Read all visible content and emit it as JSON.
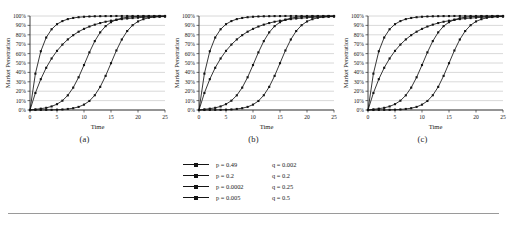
{
  "figure": {
    "panel_captions": [
      "(a)",
      "(b)",
      "(c)"
    ]
  },
  "legend": {
    "rows": [
      {
        "p_label": "p = 0.49",
        "q_label": "q = 0.002"
      },
      {
        "p_label": "p = 0.2",
        "q_label": "q = 0.2"
      },
      {
        "p_label": "p = 0.0002",
        "q_label": "q = 0.25"
      },
      {
        "p_label": "p = 0.005",
        "q_label": "q = 0.5"
      }
    ]
  },
  "chart_data": [
    {
      "type": "line",
      "title": "(a)",
      "xlabel": "Time",
      "ylabel": "Market Penetration",
      "xlim": [
        0,
        25
      ],
      "ylim": [
        0,
        1
      ],
      "grid": true,
      "legend_position": "below-figure",
      "xticks": [
        0,
        5,
        10,
        15,
        20,
        25
      ],
      "xticklabels": [
        "0",
        "5",
        "10",
        "15",
        "20",
        "25"
      ],
      "yticks": [
        0,
        0.1,
        0.2,
        0.3,
        0.4,
        0.5,
        0.6,
        0.7,
        0.8,
        0.9,
        1.0
      ],
      "yticklabels": [
        "0%",
        "10%",
        "20%",
        "30%",
        "40%",
        "50%",
        "60%",
        "70%",
        "80%",
        "90%",
        "100%"
      ],
      "x": [
        0,
        1,
        2,
        3,
        4,
        5,
        6,
        7,
        8,
        9,
        10,
        11,
        12,
        13,
        14,
        15,
        16,
        17,
        18,
        19,
        20,
        21,
        22,
        23,
        24,
        25
      ],
      "series": [
        {
          "name": "p = 0.49, q = 0.002",
          "marker": "square",
          "values": [
            0.0,
            0.387,
            0.625,
            0.771,
            0.859,
            0.913,
            0.946,
            0.967,
            0.979,
            0.987,
            0.992,
            0.995,
            0.997,
            0.998,
            0.999,
            0.999,
            1.0,
            1.0,
            1.0,
            1.0,
            1.0,
            1.0,
            1.0,
            1.0,
            1.0,
            1.0
          ]
        },
        {
          "name": "p = 0.2, q = 0.2",
          "marker": "square",
          "values": [
            0.0,
            0.181,
            0.328,
            0.449,
            0.548,
            0.629,
            0.696,
            0.751,
            0.796,
            0.833,
            0.863,
            0.888,
            0.908,
            0.925,
            0.939,
            0.95,
            0.959,
            0.967,
            0.973,
            0.978,
            0.982,
            0.986,
            0.989,
            0.991,
            0.993,
            0.994
          ]
        },
        {
          "name": "p = 0.0002, q = 0.25",
          "marker": "square",
          "values": [
            0.0,
            0.0003,
            0.0006,
            0.0011,
            0.002,
            0.0035,
            0.006,
            0.011,
            0.019,
            0.033,
            0.057,
            0.096,
            0.157,
            0.246,
            0.363,
            0.498,
            0.633,
            0.75,
            0.84,
            0.902,
            0.942,
            0.966,
            0.981,
            0.989,
            0.994,
            0.997
          ]
        },
        {
          "name": "p = 0.005, q = 0.5",
          "marker": "square",
          "values": [
            0.0,
            0.007,
            0.014,
            0.023,
            0.038,
            0.062,
            0.099,
            0.156,
            0.238,
            0.348,
            0.478,
            0.613,
            0.733,
            0.826,
            0.892,
            0.934,
            0.961,
            0.977,
            0.987,
            0.992,
            0.996,
            0.997,
            0.998,
            0.999,
            1.0,
            1.0
          ]
        }
      ]
    },
    {
      "type": "line",
      "title": "(b)",
      "xlabel": "Time",
      "ylabel": "Market Penetration",
      "xlim": [
        0,
        25
      ],
      "ylim": [
        0,
        1
      ],
      "grid": true,
      "legend_position": "below-figure",
      "xticks": [
        0,
        5,
        10,
        15,
        20,
        25
      ],
      "xticklabels": [
        "0",
        "5",
        "10",
        "15",
        "20",
        "25"
      ],
      "yticks": [
        0,
        0.1,
        0.2,
        0.3,
        0.4,
        0.5,
        0.6,
        0.7,
        0.8,
        0.9,
        1.0
      ],
      "yticklabels": [
        "0%",
        "10%",
        "20%",
        "30%",
        "40%",
        "50%",
        "60%",
        "70%",
        "80%",
        "90%",
        "100%"
      ],
      "x": [
        0,
        1,
        2,
        3,
        4,
        5,
        6,
        7,
        8,
        9,
        10,
        11,
        12,
        13,
        14,
        15,
        16,
        17,
        18,
        19,
        20,
        21,
        22,
        23,
        24,
        25
      ],
      "series": [
        {
          "name": "p = 0.49, q = 0.002",
          "marker": "square",
          "values": [
            0.0,
            0.387,
            0.625,
            0.771,
            0.859,
            0.913,
            0.946,
            0.967,
            0.979,
            0.987,
            0.992,
            0.995,
            0.997,
            0.998,
            0.999,
            0.999,
            1.0,
            1.0,
            1.0,
            1.0,
            1.0,
            1.0,
            1.0,
            1.0,
            1.0,
            1.0
          ]
        },
        {
          "name": "p = 0.2, q = 0.2",
          "marker": "square",
          "values": [
            0.0,
            0.181,
            0.328,
            0.449,
            0.548,
            0.629,
            0.696,
            0.751,
            0.796,
            0.833,
            0.863,
            0.888,
            0.908,
            0.925,
            0.939,
            0.95,
            0.959,
            0.967,
            0.973,
            0.978,
            0.982,
            0.986,
            0.989,
            0.991,
            0.993,
            0.994
          ]
        },
        {
          "name": "p = 0.0002, q = 0.25",
          "marker": "square",
          "values": [
            0.0,
            0.0003,
            0.0006,
            0.0011,
            0.002,
            0.0035,
            0.006,
            0.011,
            0.019,
            0.033,
            0.057,
            0.096,
            0.157,
            0.246,
            0.363,
            0.498,
            0.633,
            0.75,
            0.84,
            0.902,
            0.942,
            0.966,
            0.981,
            0.989,
            0.994,
            0.997
          ]
        },
        {
          "name": "p = 0.005, q = 0.5",
          "marker": "square",
          "values": [
            0.0,
            0.007,
            0.014,
            0.023,
            0.038,
            0.062,
            0.099,
            0.156,
            0.238,
            0.348,
            0.478,
            0.613,
            0.733,
            0.826,
            0.892,
            0.934,
            0.961,
            0.977,
            0.987,
            0.992,
            0.996,
            0.997,
            0.998,
            0.999,
            1.0,
            1.0
          ]
        }
      ]
    },
    {
      "type": "line",
      "title": "(c)",
      "xlabel": "Time",
      "ylabel": "Market Penetration",
      "xlim": [
        0,
        25
      ],
      "ylim": [
        0,
        1
      ],
      "grid": true,
      "legend_position": "below-figure",
      "xticks": [
        0,
        5,
        10,
        15,
        20,
        25
      ],
      "xticklabels": [
        "0",
        "5",
        "10",
        "15",
        "20",
        "25"
      ],
      "yticks": [
        0,
        0.1,
        0.2,
        0.3,
        0.4,
        0.5,
        0.6,
        0.7,
        0.8,
        0.9,
        1.0
      ],
      "yticklabels": [
        "0%",
        "10%",
        "20%",
        "30%",
        "40%",
        "50%",
        "60%",
        "70%",
        "80%",
        "90%",
        "100%"
      ],
      "x": [
        0,
        1,
        2,
        3,
        4,
        5,
        6,
        7,
        8,
        9,
        10,
        11,
        12,
        13,
        14,
        15,
        16,
        17,
        18,
        19,
        20,
        21,
        22,
        23,
        24,
        25
      ],
      "series": [
        {
          "name": "p = 0.49, q = 0.002",
          "marker": "square",
          "values": [
            0.0,
            0.387,
            0.625,
            0.771,
            0.859,
            0.913,
            0.946,
            0.967,
            0.979,
            0.987,
            0.992,
            0.995,
            0.997,
            0.998,
            0.999,
            0.999,
            1.0,
            1.0,
            1.0,
            1.0,
            1.0,
            1.0,
            1.0,
            1.0,
            1.0,
            1.0
          ]
        },
        {
          "name": "p = 0.2, q = 0.2",
          "marker": "square",
          "values": [
            0.0,
            0.181,
            0.328,
            0.449,
            0.548,
            0.629,
            0.696,
            0.751,
            0.796,
            0.833,
            0.863,
            0.888,
            0.908,
            0.925,
            0.939,
            0.95,
            0.959,
            0.967,
            0.973,
            0.978,
            0.982,
            0.986,
            0.989,
            0.991,
            0.993,
            0.994
          ]
        },
        {
          "name": "p = 0.0002, q = 0.25",
          "marker": "square",
          "values": [
            0.0,
            0.0003,
            0.0006,
            0.0011,
            0.002,
            0.0035,
            0.006,
            0.011,
            0.019,
            0.033,
            0.057,
            0.096,
            0.157,
            0.246,
            0.363,
            0.498,
            0.633,
            0.75,
            0.84,
            0.902,
            0.942,
            0.966,
            0.981,
            0.989,
            0.994,
            0.997
          ]
        },
        {
          "name": "p = 0.005, q = 0.5",
          "marker": "square",
          "values": [
            0.0,
            0.007,
            0.014,
            0.023,
            0.038,
            0.062,
            0.099,
            0.156,
            0.238,
            0.348,
            0.478,
            0.613,
            0.733,
            0.826,
            0.892,
            0.934,
            0.961,
            0.977,
            0.987,
            0.992,
            0.996,
            0.997,
            0.998,
            0.999,
            1.0,
            1.0
          ]
        }
      ]
    }
  ]
}
